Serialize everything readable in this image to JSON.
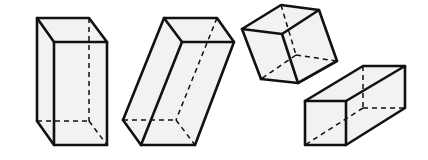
{
  "figure": {
    "colors": {
      "edge": "#111111",
      "face": "#f2f2f2",
      "background": "#ffffff"
    },
    "shapes": [
      {
        "id": "prism-upright",
        "orientation": "standing vertically"
      },
      {
        "id": "prism-tilted",
        "orientation": "leaning/tilted"
      },
      {
        "id": "cube-rotated",
        "orientation": "rotated in the air"
      },
      {
        "id": "prism-lying",
        "orientation": "lying horizontally"
      }
    ]
  }
}
